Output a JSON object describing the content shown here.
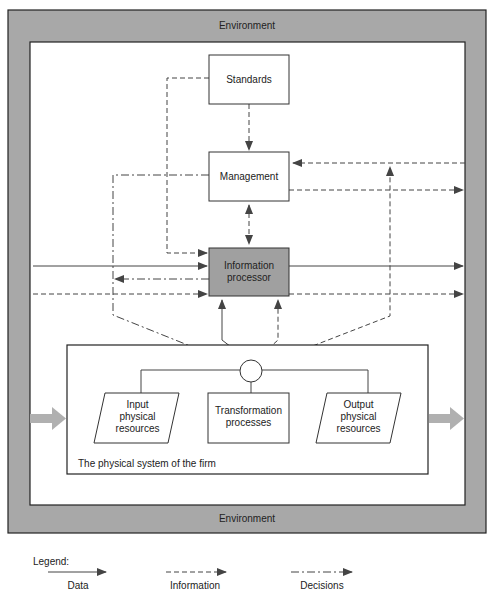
{
  "environment": {
    "top_label": "Environment",
    "bottom_label": "Environment"
  },
  "nodes": {
    "standards": "Standards",
    "management": "Management",
    "information_processor_line1": "Information",
    "information_processor_line2": "processor",
    "input_line1": "Input",
    "input_line2": "physical",
    "input_line3": "resources",
    "transformation_line1": "Transformation",
    "transformation_line2": "processes",
    "output_line1": "Output",
    "output_line2": "physical",
    "output_line3": "resources"
  },
  "physical_system": {
    "label": "The physical system of the firm"
  },
  "legend": {
    "title": "Legend:",
    "items": [
      {
        "label": "Data",
        "style": "solid"
      },
      {
        "label": "Information",
        "style": "dashed"
      },
      {
        "label": "Decisions",
        "style": "dash-dot"
      }
    ]
  },
  "colors": {
    "environment_fill": "#a8a8a8",
    "processor_fill": "#a0a0a0",
    "line": "#444444",
    "flow_arrow": "#b0b0b0"
  }
}
